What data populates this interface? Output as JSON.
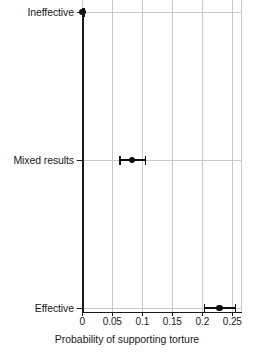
{
  "chart_data": {
    "type": "scatter",
    "title": "",
    "subtitle": "",
    "xlabel": "Probability of supporting torture",
    "ylabel": "",
    "xlim": [
      0,
      0.2667
    ],
    "grid": true,
    "legend": "none",
    "orientation": "horizontal",
    "categories": [
      "Ineffective",
      "Mixed results",
      "Effective"
    ],
    "x_ticks": [
      {
        "value": 0,
        "label": "0"
      },
      {
        "value": 0.05,
        "label": "0.05"
      },
      {
        "value": 0.1,
        "label": "0.1"
      },
      {
        "value": 0.15,
        "label": "0.15"
      },
      {
        "value": 0.2,
        "label": "0.2"
      },
      {
        "value": 0.25,
        "label": "0.25"
      }
    ],
    "reference_line": {
      "value": 0,
      "style": "solid",
      "color": "#1a1a1a"
    },
    "points": [
      {
        "category": "Ineffective",
        "estimate": 0.0,
        "ci_low": 0.0,
        "ci_high": 0.002,
        "estimate_label": "0",
        "ci_label": "[0, 0.002]"
      },
      {
        "category": "Mixed results",
        "estimate": 0.083,
        "ci_low": 0.062,
        "ci_high": 0.104,
        "estimate_label": "0.083",
        "ci_label": "[0.062, 0.104]"
      },
      {
        "category": "Effective",
        "estimate": 0.229,
        "ci_low": 0.203,
        "ci_high": 0.254,
        "estimate_label": "0.229",
        "ci_label": "[0.203, 0.254]"
      }
    ],
    "colors": {
      "point": "#101010",
      "errorbar": "#101010",
      "grid": "#c9c9c9",
      "axis": "#1a1a1a",
      "background": "#ffffff"
    }
  }
}
